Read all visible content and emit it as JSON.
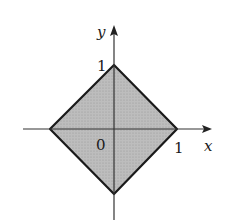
{
  "figure": {
    "axes": {
      "x_label": "x",
      "y_label": "y",
      "origin_label": "0",
      "x_tick_label": "1",
      "y_tick_label": "1"
    },
    "region": {
      "vertices": [
        [
          0,
          1
        ],
        [
          1,
          0
        ],
        [
          0,
          -1
        ],
        [
          -1,
          0
        ]
      ],
      "fill_color": "#b3b3b3",
      "stroke_color": "#1a1a1a"
    }
  }
}
